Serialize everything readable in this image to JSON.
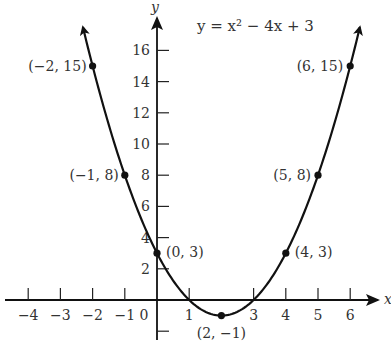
{
  "chart_data": {
    "type": "line",
    "title": "y = x² − 4x + 3",
    "xlabel": "x",
    "ylabel": "y",
    "xlim": [
      -4.5,
      6.9
    ],
    "ylim": [
      -2.3,
      18.5
    ],
    "grid": false,
    "x_ticks": [
      -4,
      -3,
      -2,
      -1,
      0,
      1,
      3,
      4,
      5,
      6
    ],
    "x_tick_labels": [
      "−4",
      "−3",
      "−2",
      "−1",
      "0",
      "1",
      "3",
      "4",
      "5",
      "6"
    ],
    "y_ticks": [
      2,
      4,
      6,
      8,
      10,
      12,
      14,
      16
    ],
    "y_tick_labels": [
      "2",
      "4",
      "6",
      "8",
      "10",
      "12",
      "14",
      "16"
    ],
    "series": [
      {
        "name": "y = x² − 4x + 3",
        "function": "x^2 - 4x + 3",
        "domain": [
          -2.3,
          6.3
        ]
      }
    ],
    "points": [
      {
        "x": -2,
        "y": 15,
        "label": "(−2, 15)"
      },
      {
        "x": -1,
        "y": 8,
        "label": "(−1, 8)"
      },
      {
        "x": 0,
        "y": 3,
        "label": "(0, 3)"
      },
      {
        "x": 2,
        "y": -1,
        "label": "(2, −1)"
      },
      {
        "x": 4,
        "y": 3,
        "label": "(4, 3)"
      },
      {
        "x": 5,
        "y": 8,
        "label": "(5, 8)"
      },
      {
        "x": 6,
        "y": 15,
        "label": "(6, 15)"
      }
    ]
  }
}
